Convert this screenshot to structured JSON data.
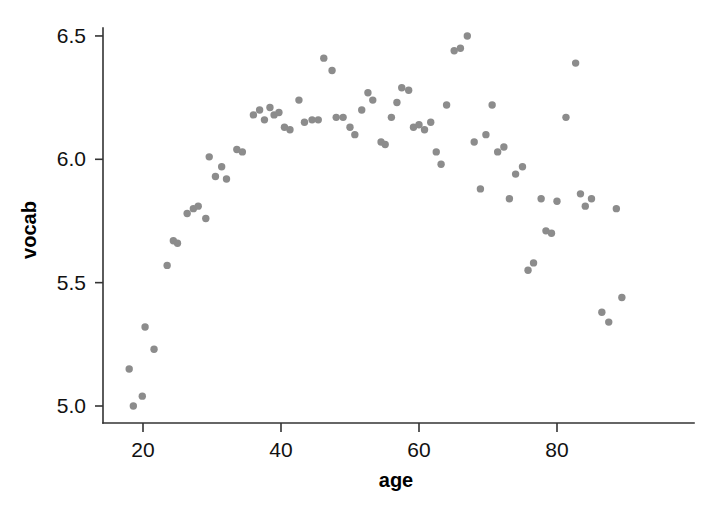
{
  "chart_data": {
    "type": "scatter",
    "title": "",
    "subtitle": "",
    "xlabel": "age",
    "ylabel": "vocab",
    "xlim": [
      16.5,
      91
    ],
    "ylim": [
      4.93,
      6.58
    ],
    "xticks": [
      20,
      40,
      60,
      80
    ],
    "xtick_labels": [
      "20",
      "40",
      "60",
      "80"
    ],
    "yticks": [
      5.0,
      5.5,
      6.0,
      6.5
    ],
    "ytick_labels": [
      "5.0",
      "5.5",
      "6.0",
      "6.5"
    ],
    "grid": false,
    "legend": null,
    "marker": {
      "shape": "circle",
      "color": "#8c8c8c",
      "size": 5.2
    },
    "annotations": [],
    "series": [
      {
        "name": "vocab by age",
        "points": [
          [
            18.0,
            5.15
          ],
          [
            18.6,
            5.0
          ],
          [
            19.9,
            5.04
          ],
          [
            20.3,
            5.32
          ],
          [
            21.6,
            5.23
          ],
          [
            23.5,
            5.57
          ],
          [
            24.4,
            5.67
          ],
          [
            25.0,
            5.66
          ],
          [
            26.4,
            5.78
          ],
          [
            27.3,
            5.8
          ],
          [
            28.0,
            5.81
          ],
          [
            29.1,
            5.76
          ],
          [
            29.6,
            6.01
          ],
          [
            30.5,
            5.93
          ],
          [
            31.4,
            5.97
          ],
          [
            32.1,
            5.92
          ],
          [
            33.6,
            6.04
          ],
          [
            34.4,
            6.03
          ],
          [
            36.0,
            6.18
          ],
          [
            36.9,
            6.2
          ],
          [
            37.6,
            6.16
          ],
          [
            38.4,
            6.21
          ],
          [
            39.0,
            6.18
          ],
          [
            39.7,
            6.19
          ],
          [
            40.5,
            6.13
          ],
          [
            41.3,
            6.12
          ],
          [
            42.6,
            6.24
          ],
          [
            43.4,
            6.15
          ],
          [
            44.5,
            6.16
          ],
          [
            45.4,
            6.16
          ],
          [
            46.2,
            6.41
          ],
          [
            47.4,
            6.36
          ],
          [
            48.0,
            6.17
          ],
          [
            49.0,
            6.17
          ],
          [
            50.0,
            6.13
          ],
          [
            50.7,
            6.1
          ],
          [
            51.7,
            6.2
          ],
          [
            52.6,
            6.27
          ],
          [
            53.3,
            6.24
          ],
          [
            54.5,
            6.07
          ],
          [
            55.1,
            6.06
          ],
          [
            56.0,
            6.17
          ],
          [
            56.8,
            6.23
          ],
          [
            57.5,
            6.29
          ],
          [
            58.5,
            6.28
          ],
          [
            59.2,
            6.13
          ],
          [
            60.0,
            6.14
          ],
          [
            60.8,
            6.12
          ],
          [
            61.7,
            6.15
          ],
          [
            62.5,
            6.03
          ],
          [
            63.2,
            5.98
          ],
          [
            64.0,
            6.22
          ],
          [
            65.1,
            6.44
          ],
          [
            66.0,
            6.45
          ],
          [
            67.0,
            6.5
          ],
          [
            68.0,
            6.07
          ],
          [
            68.9,
            5.88
          ],
          [
            69.7,
            6.1
          ],
          [
            70.6,
            6.22
          ],
          [
            71.4,
            6.03
          ],
          [
            72.3,
            6.05
          ],
          [
            73.1,
            5.84
          ],
          [
            74.0,
            5.94
          ],
          [
            75.0,
            5.97
          ],
          [
            75.8,
            5.55
          ],
          [
            76.6,
            5.58
          ],
          [
            77.7,
            5.84
          ],
          [
            78.4,
            5.71
          ],
          [
            79.2,
            5.7
          ],
          [
            80.0,
            5.83
          ],
          [
            81.3,
            6.17
          ],
          [
            82.7,
            6.39
          ],
          [
            83.4,
            5.86
          ],
          [
            84.1,
            5.81
          ],
          [
            85.0,
            5.84
          ],
          [
            86.5,
            5.38
          ],
          [
            87.5,
            5.34
          ],
          [
            88.6,
            5.8
          ],
          [
            89.4,
            5.44
          ]
        ]
      }
    ]
  },
  "axes": {
    "x_title": "age",
    "y_title": "vocab",
    "x_tick_labels": [
      "20",
      "40",
      "60",
      "80"
    ],
    "y_tick_labels": [
      "5.0",
      "5.5",
      "6.0",
      "6.5"
    ]
  },
  "colors": {
    "point": "#8c8c8c",
    "axis": "#333333",
    "text": "#111111",
    "background": "#ffffff"
  }
}
